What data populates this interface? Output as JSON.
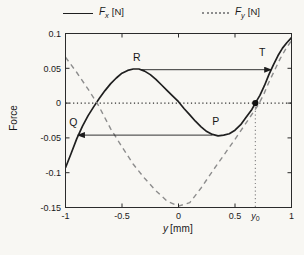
{
  "figure": {
    "background": "#f8f7f3",
    "axis_color": "#2b2b2b",
    "text_color": "#1a1a1a"
  },
  "legend": {
    "items": [
      {
        "id": "fx",
        "symbol": "F",
        "sub": "x",
        "unit": "[N]",
        "line_style": "solid",
        "line_color": "#1f1f1f"
      },
      {
        "id": "fy",
        "symbol": "F",
        "sub": "y",
        "unit": "[N]",
        "line_style": "dotted",
        "line_color": "#8d8d8d"
      }
    ]
  },
  "axes": {
    "ylabel": "Force",
    "xlabel_symbol": "y",
    "xlabel_unit": "[mm]",
    "x_tick_labels": [
      "-1",
      "-0.5",
      "0",
      "0.5",
      "1"
    ],
    "y_tick_labels": [
      "0.1",
      "0.05",
      "0",
      "-0.05",
      "-0.1",
      "-0.15"
    ],
    "x0_label": {
      "symbol": "y",
      "sub": "0",
      "x": 0.68
    }
  },
  "chart_data": {
    "type": "line",
    "title": "",
    "xlabel": "y [mm]",
    "ylabel": "Force",
    "xlim": [
      -1,
      1
    ],
    "ylim": [
      -0.15,
      0.1
    ],
    "x_ticks": [
      -1,
      -0.5,
      0,
      0.5,
      1
    ],
    "y_ticks": [
      0.1,
      0.05,
      0,
      -0.05,
      -0.1,
      -0.15
    ],
    "grid": false,
    "legend_position": "top",
    "series": [
      {
        "name": "Fx [N]",
        "style": "solid",
        "color": "#1f1f1f",
        "width": 1.7,
        "points": [
          [
            -1,
            -0.093
          ],
          [
            -0.95,
            -0.072
          ],
          [
            -0.9,
            -0.051
          ],
          [
            -0.85,
            -0.033
          ],
          [
            -0.8,
            -0.018
          ],
          [
            -0.75,
            -0.005
          ],
          [
            -0.7,
            0.007
          ],
          [
            -0.65,
            0.018
          ],
          [
            -0.6,
            0.028
          ],
          [
            -0.55,
            0.036
          ],
          [
            -0.5,
            0.043
          ],
          [
            -0.45,
            0.047
          ],
          [
            -0.4,
            0.049
          ],
          [
            -0.35,
            0.049
          ],
          [
            -0.3,
            0.046
          ],
          [
            -0.25,
            0.041
          ],
          [
            -0.2,
            0.034
          ],
          [
            -0.15,
            0.026
          ],
          [
            -0.1,
            0.018
          ],
          [
            -0.05,
            0.01
          ],
          [
            0,
            0.002
          ],
          [
            0.05,
            -0.008
          ],
          [
            0.1,
            -0.017
          ],
          [
            0.15,
            -0.026
          ],
          [
            0.2,
            -0.034
          ],
          [
            0.25,
            -0.041
          ],
          [
            0.3,
            -0.045
          ],
          [
            0.35,
            -0.047
          ],
          [
            0.4,
            -0.046
          ],
          [
            0.45,
            -0.044
          ],
          [
            0.5,
            -0.039
          ],
          [
            0.55,
            -0.031
          ],
          [
            0.6,
            -0.02
          ],
          [
            0.65,
            -0.009
          ],
          [
            0.68,
            0
          ],
          [
            0.72,
            0.011
          ],
          [
            0.76,
            0.025
          ],
          [
            0.8,
            0.041
          ],
          [
            0.84,
            0.055
          ],
          [
            0.88,
            0.068
          ],
          [
            0.92,
            0.079
          ],
          [
            0.96,
            0.087
          ],
          [
            1,
            0.094
          ]
        ]
      },
      {
        "name": "Fy [N]",
        "style": "dashed",
        "color": "#8d8d8d",
        "width": 1.4,
        "points": [
          [
            -1,
            0.066
          ],
          [
            -0.9,
            0.044
          ],
          [
            -0.8,
            0.02
          ],
          [
            -0.72,
            0
          ],
          [
            -0.7,
            -0.006
          ],
          [
            -0.6,
            -0.037
          ],
          [
            -0.5,
            -0.063
          ],
          [
            -0.4,
            -0.088
          ],
          [
            -0.3,
            -0.108
          ],
          [
            -0.2,
            -0.126
          ],
          [
            -0.1,
            -0.141
          ],
          [
            0,
            -0.148
          ],
          [
            0.1,
            -0.143
          ],
          [
            0.2,
            -0.122
          ],
          [
            0.3,
            -0.098
          ],
          [
            0.4,
            -0.075
          ],
          [
            0.5,
            -0.052
          ],
          [
            0.6,
            -0.028
          ],
          [
            0.7,
            -0.004
          ],
          [
            0.75,
            0.011
          ],
          [
            0.8,
            0.03
          ],
          [
            0.85,
            0.047
          ],
          [
            0.9,
            0.064
          ],
          [
            0.95,
            0.078
          ],
          [
            1,
            0.09
          ]
        ]
      }
    ],
    "annotations": {
      "labels": [
        {
          "text": "R",
          "x": -0.37,
          "y": 0.065
        },
        {
          "text": "T",
          "x": 0.74,
          "y": 0.072
        },
        {
          "text": "Q",
          "x": -0.93,
          "y": -0.028
        },
        {
          "text": "P",
          "x": 0.33,
          "y": -0.026
        }
      ],
      "arrows": [
        {
          "x1": -0.33,
          "y1": 0.048,
          "x2": 0.82,
          "y2": 0.048
        },
        {
          "x1": 0.3,
          "y1": -0.046,
          "x2": -0.89,
          "y2": -0.046
        }
      ],
      "marker_point": {
        "x": 0.68,
        "y": 0,
        "r": 3.1,
        "color": "#111111"
      },
      "zero_line": {
        "y": 0,
        "color": "#2f2f2f"
      },
      "vline": {
        "x": 0.68,
        "y_from": 0,
        "y_to": -0.15,
        "color": "#828282"
      }
    }
  }
}
